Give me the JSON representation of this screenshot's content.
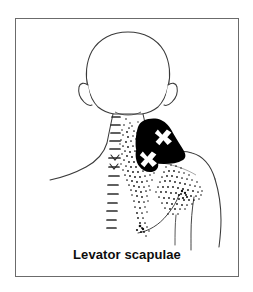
{
  "figure": {
    "caption": "Levator scapulae",
    "view_label": "posterior-body-view",
    "muscle_name": "Levator scapulae"
  },
  "colors": {
    "background": "#ffffff",
    "frame_border": "#6b6b6b",
    "body_outline": "#3a3a3a",
    "essential_pain_zone": "#000000",
    "spillover_stipple": "#111111",
    "trigger_point_marker": "#ffffff",
    "caption_text": "#0d0d0d"
  },
  "legend_semantics": {
    "solid_black_label": "essential referred pain zone",
    "stipple_label": "spillover referred pain zone",
    "x_marker_label": "trigger point"
  },
  "trigger_points": [
    {
      "id": "tp-upper",
      "label": "X",
      "x": 148,
      "y": 110
    },
    {
      "id": "tp-lower",
      "label": "X",
      "x": 138,
      "y": 127
    }
  ],
  "anatomy_parts": [
    {
      "name": "head"
    },
    {
      "name": "left-ear"
    },
    {
      "name": "right-ear"
    },
    {
      "name": "neck"
    },
    {
      "name": "spinous-process-column"
    },
    {
      "name": "left-shoulder"
    },
    {
      "name": "right-shoulder"
    },
    {
      "name": "right-arm"
    },
    {
      "name": "scapula-region"
    }
  ]
}
